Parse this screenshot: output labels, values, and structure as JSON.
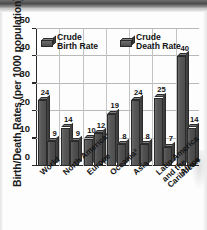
{
  "chart_data": {
    "type": "bar",
    "title": "",
    "xlabel": "",
    "ylabel": "Birth/Death Rates (per 1000 population)",
    "ylim": [
      0,
      50
    ],
    "yticks": [
      0,
      10,
      20,
      30,
      40,
      50
    ],
    "grid": true,
    "legend_position": "top-inside",
    "categories": [
      "World",
      "North America¹",
      "Europe",
      "Oceania²",
      "Asia",
      "Latin America\nand the\nCaribbean",
      "Africa"
    ],
    "series": [
      {
        "name": "Crude Birth Rate",
        "values": [
          24,
          14,
          10,
          19,
          24,
          25,
          40
        ]
      },
      {
        "name": "Crude Death Rate",
        "values": [
          9,
          9,
          12,
          8,
          8,
          7,
          14
        ]
      }
    ]
  },
  "axis": {
    "y_title": "Birth/Death Rates (per 1000 population)",
    "tick_labels": [
      "50",
      "40",
      "30",
      "20",
      "10",
      "0"
    ]
  },
  "legend": {
    "items": [
      {
        "label": "Crude\nBirth Rate",
        "icon": "cube-icon"
      },
      {
        "label": "Crude\nDeath Rate",
        "icon": "cube-icon"
      }
    ]
  },
  "colors": {
    "bar_front": "#565656",
    "bar_top": "#7d7d7d",
    "bar_side": "#3f3f3f",
    "axis": "#2a2a2a",
    "grid": "#bcbcbc",
    "text": "#141414",
    "background": "#fdfdfd"
  }
}
